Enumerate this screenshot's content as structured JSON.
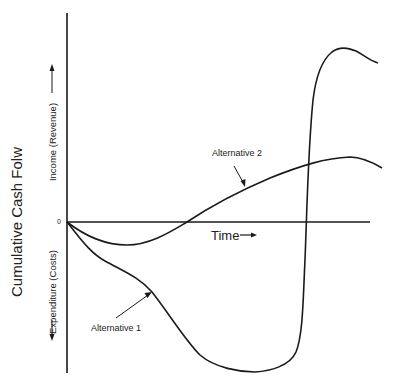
{
  "diagram": {
    "y_axis_title": "Cumulative Cash Folw",
    "income_label": "Income (Revenue)",
    "expenditure_label": "Expenditure (Costs)",
    "origin_label": "0",
    "x_axis_label": "Time",
    "series": [
      {
        "name": "Alternative 1",
        "label": "Alternative 1"
      },
      {
        "name": "Alternative 2",
        "label": "Alternative 2"
      }
    ],
    "colors": {
      "line": "#1a1a1a",
      "text": "#222222"
    }
  }
}
